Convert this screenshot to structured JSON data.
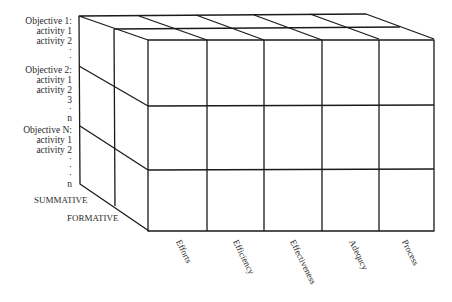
{
  "diagram": {
    "type": "3d-cube-matrix",
    "row_labels": [
      {
        "objective": "Objective 1:",
        "items": [
          "activity 1",
          "activity 2",
          "·",
          "·"
        ]
      },
      {
        "objective": "Objective 2:",
        "items": [
          "activity 1",
          "activity 2",
          "3",
          "·",
          "n"
        ]
      },
      {
        "objective": "Objective N:",
        "items": [
          "activity 1",
          "activity 2",
          "·",
          "·",
          "·",
          "n"
        ]
      }
    ],
    "depth_labels": [
      "SUMMATIVE",
      "FORMATIVE"
    ],
    "column_labels": [
      "Efforts",
      "Efficiency",
      "Effectiveness",
      "Adequcy",
      "Process"
    ],
    "grid": {
      "rows": 3,
      "columns": 5,
      "depth": 2
    },
    "line_color": "#1a1a1a"
  }
}
